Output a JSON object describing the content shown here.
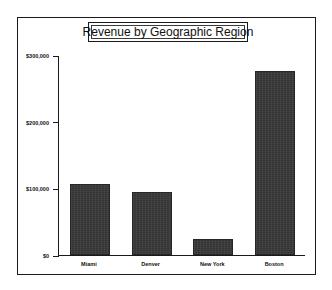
{
  "chart_data": {
    "type": "bar",
    "title": "Revenue by Geographic Region",
    "xlabel": "",
    "ylabel": "",
    "categories": [
      "Miami",
      "Denver",
      "New York",
      "Boston"
    ],
    "values": [
      107000,
      95000,
      24000,
      276000
    ],
    "ylim": [
      0,
      300000
    ],
    "yticks": [
      0,
      100000,
      200000,
      300000
    ],
    "ytick_labels": [
      "$0",
      "$100,000",
      "$200,000",
      "$300,000"
    ],
    "grid": false,
    "legend": null,
    "series": [
      {
        "name": "Revenue",
        "values": [
          107000,
          95000,
          24000,
          276000
        ],
        "color": "#343434"
      }
    ]
  },
  "figure": {
    "background_color": "#ffffff",
    "border_color": "#1a1a1a",
    "bar_color": "#343434",
    "text_color": "#111111"
  }
}
